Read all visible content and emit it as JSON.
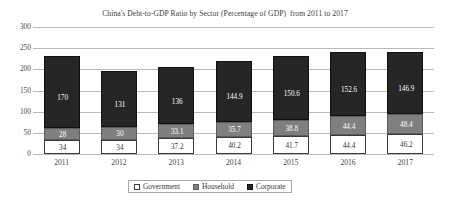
{
  "chart_data": {
    "type": "bar",
    "subtype": "stacked-column",
    "title": "China's Debt-to-GDP Ratio by Sector (Percentage of GDP)  from 2011 to 2017",
    "xlabel": "",
    "ylabel": "",
    "categories": [
      "2011",
      "2012",
      "2013",
      "2014",
      "2015",
      "2016",
      "2017"
    ],
    "ylim": [
      0,
      300
    ],
    "yticks": [
      0,
      50,
      100,
      150,
      200,
      250,
      300
    ],
    "ytick_labels": [
      "0",
      "50",
      "100",
      "150",
      "200",
      "250",
      "300"
    ],
    "grid": true,
    "grid_axis": "y",
    "legend_position": "bottom-center",
    "stack_order_bottom_to_top": [
      "Government",
      "Household",
      "Corporate"
    ],
    "series": [
      {
        "name": "Government",
        "color": "#ffffff",
        "values": [
          34,
          34,
          37.2,
          40.2,
          41.7,
          44.4,
          46.2
        ],
        "labels": [
          "34",
          "34",
          "37.2",
          "40.2",
          "41.7",
          "44.4",
          "46.2"
        ]
      },
      {
        "name": "Household",
        "color": "#7f7f7f",
        "values": [
          28,
          30,
          33.1,
          35.7,
          38.8,
          44.4,
          48.4
        ],
        "labels": [
          "28",
          "30",
          "33.1",
          "35.7",
          "38.8",
          "44.4",
          "48.4"
        ]
      },
      {
        "name": "Corporate",
        "color": "#262626",
        "values": [
          170,
          131,
          136,
          144.9,
          150.6,
          152.6,
          146.9
        ],
        "labels": [
          "170",
          "131",
          "136",
          "144.9",
          "150.6",
          "152.6",
          "146.9"
        ]
      }
    ],
    "totals": [
      232,
      195,
      206.3,
      220.8,
      231.1,
      241.4,
      241.5
    ]
  },
  "legend": {
    "items": [
      {
        "label": "Government",
        "swatch": "government-swatch"
      },
      {
        "label": "Household",
        "swatch": "household-swatch"
      },
      {
        "label": "Corporate",
        "swatch": "corporate-swatch"
      }
    ]
  }
}
